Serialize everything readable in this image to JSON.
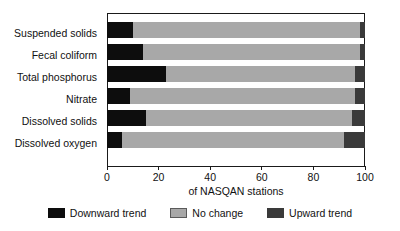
{
  "chart_data": {
    "type": "bar",
    "orientation": "horizontal",
    "stacked": true,
    "title": "",
    "xlabel": "of NASQAN stations",
    "ylabel": "",
    "xlim": [
      0,
      100
    ],
    "xticks": [
      0,
      20,
      40,
      60,
      80,
      100
    ],
    "xtick_labels": [
      "0",
      "20",
      "40",
      "60",
      "80",
      "100"
    ],
    "grid": false,
    "legend_position": "bottom",
    "categories": [
      "Suspended solids",
      "Fecal coliform",
      "Total phosphorus",
      "Nitrate",
      "Dissolved solids",
      "Dissolved oxygen"
    ],
    "series": [
      {
        "name": "Downward trend",
        "color": "#0d0d0d",
        "values": [
          10,
          14,
          23,
          9,
          15,
          6
        ]
      },
      {
        "name": "No change",
        "color": "#a8a8a8",
        "values": [
          88,
          84,
          73,
          87,
          80,
          86
        ]
      },
      {
        "name": "Upward trend",
        "color": "#3a3a3a",
        "values": [
          2,
          2,
          4,
          4,
          5,
          8
        ]
      }
    ]
  },
  "legend": {
    "items": [
      {
        "label": "Downward trend",
        "swatch": "black-square-icon"
      },
      {
        "label": "No change",
        "swatch": "gray-square-icon"
      },
      {
        "label": "Upward trend",
        "swatch": "dark-gray-square-icon"
      }
    ]
  },
  "axis": {
    "x_title": "of NASQAN stations"
  }
}
